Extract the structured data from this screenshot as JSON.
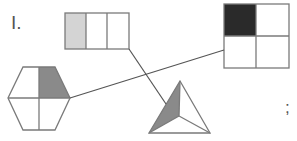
{
  "problem": {
    "number_label": "I.",
    "end_punct": ";"
  },
  "colors": {
    "stroke": "#7a7a7a",
    "light_fill": "#d4d4d4",
    "medium_fill": "#8a8a8a",
    "dark_fill": "#2a2a2a",
    "background": "#ffffff"
  },
  "shapes": [
    {
      "id": "rectangle",
      "parts": 3,
      "shaded": 1,
      "fraction": "1/3",
      "shade": "light"
    },
    {
      "id": "square",
      "parts": 4,
      "shaded": 1,
      "fraction": "1/4",
      "shade": "dark"
    },
    {
      "id": "hexagon",
      "parts": 4,
      "shaded": 1,
      "fraction": "1/4",
      "shade": "medium"
    },
    {
      "id": "triangle",
      "parts": 3,
      "shaded": 1,
      "fraction": "1/3",
      "shade": "medium"
    }
  ],
  "connections": [
    {
      "from": "rectangle",
      "to": "triangle"
    },
    {
      "from": "hexagon",
      "to": "square"
    }
  ]
}
